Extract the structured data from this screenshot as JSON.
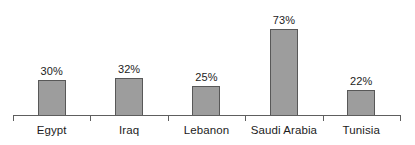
{
  "chart_data": {
    "type": "bar",
    "title": "",
    "subtitle": "",
    "xlabel": "",
    "ylabel": "",
    "ylim": [
      0,
      80
    ],
    "grid": false,
    "legend": null,
    "value_suffix": "%",
    "categories": [
      "Egypt",
      "Iraq",
      "Lebanon",
      "Saudi Arabia",
      "Tunisia"
    ],
    "values": [
      30,
      32,
      25,
      73,
      22
    ],
    "data_labels": [
      "30%",
      "32%",
      "25%",
      "73%",
      "22%"
    ],
    "bar_fill": "#9d9d9d",
    "bar_border": "#585858",
    "axis_color": "#5e5e5e",
    "text_color": "#1c1c1c",
    "background": "#ffffff"
  },
  "axis": {
    "tick_count": 6,
    "ticks_at_boundaries": true
  }
}
